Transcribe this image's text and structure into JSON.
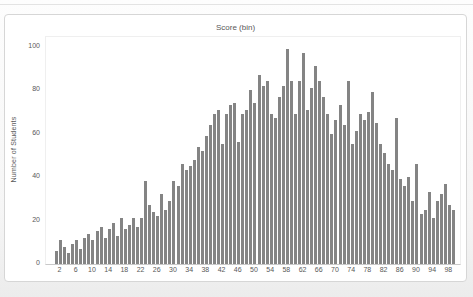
{
  "chart_data": {
    "type": "bar",
    "title": "Score (bin)",
    "xlabel": "Score (bin)",
    "ylabel": "Number of Students",
    "ylim": [
      0,
      100
    ],
    "grid": false,
    "legend": "none",
    "bar_color": "#848484",
    "text_color": "#595959",
    "y_ticks": [
      0,
      20,
      40,
      60,
      80,
      100
    ],
    "x_tick_labels": [
      2,
      6,
      10,
      14,
      18,
      22,
      26,
      30,
      34,
      38,
      42,
      46,
      50,
      54,
      58,
      62,
      66,
      70,
      74,
      78,
      82,
      86,
      90,
      94,
      98
    ],
    "x": [
      1,
      2,
      3,
      4,
      5,
      6,
      7,
      8,
      9,
      10,
      11,
      12,
      13,
      14,
      15,
      16,
      17,
      18,
      19,
      20,
      21,
      22,
      23,
      24,
      25,
      26,
      27,
      28,
      29,
      30,
      31,
      32,
      33,
      34,
      35,
      36,
      37,
      38,
      39,
      40,
      41,
      42,
      43,
      44,
      45,
      46,
      47,
      48,
      49,
      50,
      51,
      52,
      53,
      54,
      55,
      56,
      57,
      58,
      59,
      60,
      61,
      62,
      63,
      64,
      65,
      66,
      67,
      68,
      69,
      70,
      71,
      72,
      73,
      74,
      75,
      76,
      77,
      78,
      79,
      80,
      81,
      82,
      83,
      84,
      85,
      86,
      87,
      88,
      89,
      90,
      91,
      92,
      93,
      94,
      95,
      96,
      97,
      98,
      99
    ],
    "values": [
      6,
      11,
      8,
      5,
      9,
      11,
      7,
      12,
      14,
      11,
      15,
      17,
      12,
      16,
      19,
      13,
      21,
      16,
      18,
      21,
      17,
      21,
      38,
      27,
      24,
      22,
      32,
      25,
      29,
      38,
      36,
      46,
      43,
      45,
      48,
      54,
      52,
      59,
      64,
      69,
      71,
      55,
      69,
      73,
      74,
      56,
      69,
      71,
      80,
      74,
      87,
      82,
      84,
      69,
      67,
      77,
      82,
      99,
      84,
      69,
      84,
      97,
      71,
      81,
      91,
      84,
      77,
      69,
      60,
      66,
      73,
      64,
      84,
      55,
      61,
      69,
      66,
      70,
      79,
      65,
      55,
      51,
      46,
      43,
      67,
      39,
      36,
      40,
      29,
      46,
      23,
      25,
      33,
      21,
      29,
      32,
      37,
      27,
      25
    ]
  }
}
